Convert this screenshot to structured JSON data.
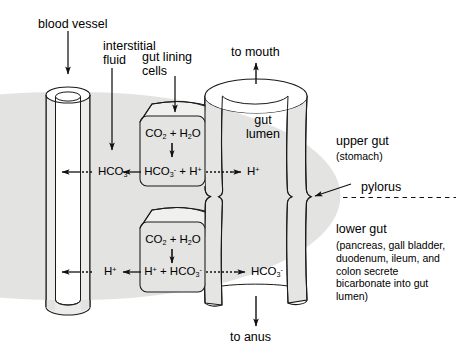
{
  "diagram": {
    "colors": {
      "tube_fill": "#e9e9e9",
      "tube_fill_light": "#f2f2f2",
      "cell_fill": "#e4e4e4",
      "stroke": "#1a1a1a",
      "background": "#ffffff"
    }
  },
  "labels": {
    "blood_vessel": "blood vessel",
    "interstitial_fluid_line1": "interstitial",
    "interstitial_fluid_line2": "fluid",
    "gut_lining_line1": "gut lining",
    "gut_lining_line2": "cells",
    "to_mouth": "to mouth",
    "to_anus": "to anus",
    "gut_lumen_line1": "gut",
    "gut_lumen_line2": "lumen",
    "upper_gut": "upper gut",
    "upper_gut_detail": "(stomach)",
    "pylorus": "pylorus",
    "lower_gut": "lower gut",
    "lower_gut_detail": "(pancreas, gall bladder, duodenum, ileum, and colon secrete bicarbonate into gut lumen)"
  },
  "upper_cell": {
    "reactant": "CO2 + H2O",
    "reactant_parts": {
      "co2": "CO",
      "co2_sub": "2",
      "plus": " + ",
      "h2o": "H",
      "h2o_sub": "2",
      "h2o_o": "O"
    },
    "products": "HCO3- + H+",
    "product_left_in_cell": "HCO3-",
    "product_right_in_cell": "H+",
    "blood_side_species": "HCO3-",
    "lumen_side_species": "H+"
  },
  "lower_cell": {
    "reactant": "CO2 + H2O",
    "products": "H+ + HCO3-",
    "product_left_in_cell": "H+",
    "product_right_in_cell": "HCO3-",
    "blood_side_species": "H+",
    "lumen_side_species": "HCO3-"
  },
  "chemistry": {
    "hco3_base": "HCO",
    "hco3_sub": "3",
    "hco3_charge": "-",
    "h_base": "H",
    "h_charge": "+",
    "co2_base": "CO",
    "co2_sub": "2",
    "h2o_h": "H",
    "h2o_sub": "2",
    "h2o_o": "O",
    "plus_sign": "+"
  }
}
